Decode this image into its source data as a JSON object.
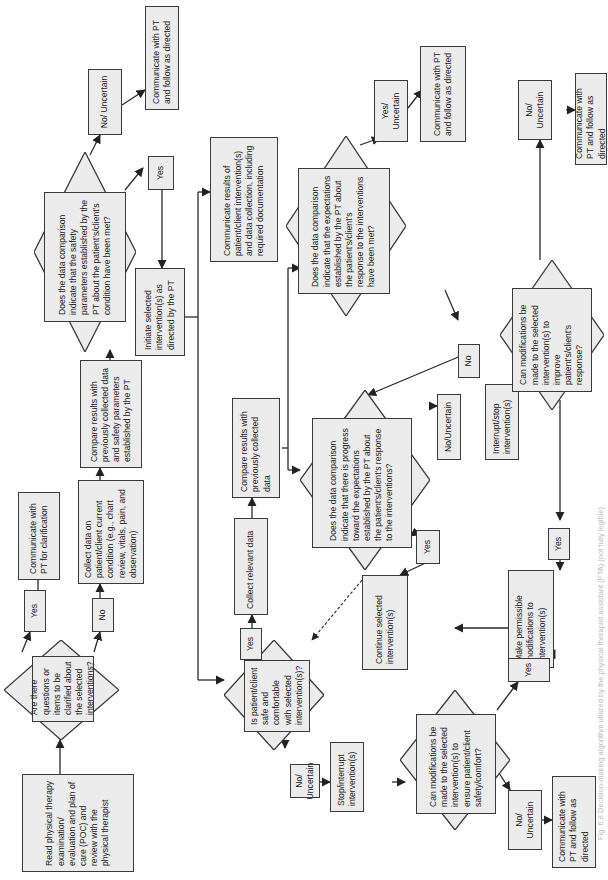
{
  "diagram": {
    "type": "flowchart",
    "orientation": "rotated-90-ccw",
    "nodes": {
      "read_poc": "Read physical therapy examination/ evaluation and plan of care (POC) and review with the physical therapist",
      "q_clarify": "Are there questions or items to be clarified about the selected interventions?",
      "yes_clarify": "Yes",
      "communicate_clarification": "Communicate with PT for clarification",
      "no_clarify": "No",
      "collect_current": "Collect data on patient/client current condition (e.g., chart review, vitals, pain, and observation)",
      "compare_safety": "Compare results with previously collected data and safety parameters established by the PT",
      "q_safety": "Does the data comparison indicate that the safety parameters established by the PT about the patient's/client's condition have been met?",
      "no_uncertain_safety": "No/ Uncertain",
      "communicate_follow_1": "Communicate with PT and follow as directed",
      "yes_safety": "Yes",
      "initiate": "Initiate selected intervention(s) as directed by the PT",
      "communicate_results": "Communicate results of patient/client intervention(s) and data collection, including required documentation",
      "q_safe_comfortable": "Is patient/client safe and comfortable with selected intervention(s)?",
      "yes_safe": "Yes",
      "collect_relevant": "Collect relevant data",
      "compare_previous": "Compare results with previously collected data",
      "q_expectations_met": "Does the data comparison indicate that the expectations established by the PT about the patient's/client's response to the interventions have been met?",
      "yes_uncertain_met": "Yes/ Uncertain",
      "communicate_follow_2": "Communicate with PT and follow as directed",
      "no_met": "No",
      "q_progress": "Does the data comparison indicate that there is progress toward the expectations established by the PT about the patient's/client's response to the interventions?",
      "no_uncertain_progress": "No/Uncertain",
      "interrupt_stop": "Interrupt/stop intervention(s)",
      "q_modify_improve": "Can modifications be made to the selected intervention(s) to improve patient's/client's response?",
      "no_uncertain_improve": "No/ Uncertain",
      "communicate_follow_3": "Communicate with PT and follow as directed",
      "yes_progress": "Yes",
      "continue": "Continue selected intervention(s)",
      "yes_improve": "Yes",
      "make_modifications": "Make permissible modifications to intervention(s)",
      "no_uncertain_safe": "No/ Uncertain",
      "stop_interrupt": "Stop/interrupt intervention(s)",
      "q_modify_safety": "Can modifications be made to the selected intervention(s) to ensure patient/client safety/comfort?",
      "yes_modify_safety": "Yes",
      "no_uncertain_modify_safety": "No/ Uncertain",
      "communicate_follow_4": "Communicate with PT and follow as directed"
    },
    "caption": "Fig. 6.8 Decision-making algorithm utilized by the physical therapist assistant (PTA) (not fully legible)"
  }
}
